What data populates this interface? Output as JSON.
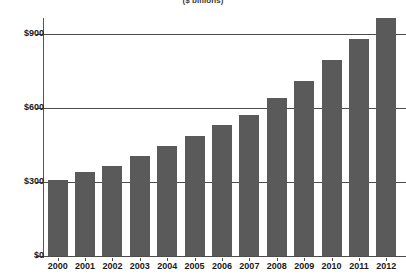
{
  "chart_data": {
    "type": "bar",
    "title": "($ billions)",
    "xlabel": "",
    "ylabel": "",
    "categories": [
      "2000",
      "2001",
      "2002",
      "2003",
      "2004",
      "2005",
      "2006",
      "2007",
      "2008",
      "2009",
      "2010",
      "2011",
      "2012"
    ],
    "values": [
      310,
      340,
      365,
      405,
      445,
      485,
      530,
      570,
      640,
      710,
      795,
      880,
      965
    ],
    "ylim": [
      0,
      1000
    ],
    "yticks": [
      0,
      300,
      600,
      900
    ],
    "ytick_labels": [
      "$0",
      "$300",
      "$600",
      "$900"
    ],
    "grid": true,
    "legend": false,
    "bar_color": "#5a5a5a",
    "axis_color": "#4c4c4c",
    "background": "#ffffff"
  }
}
